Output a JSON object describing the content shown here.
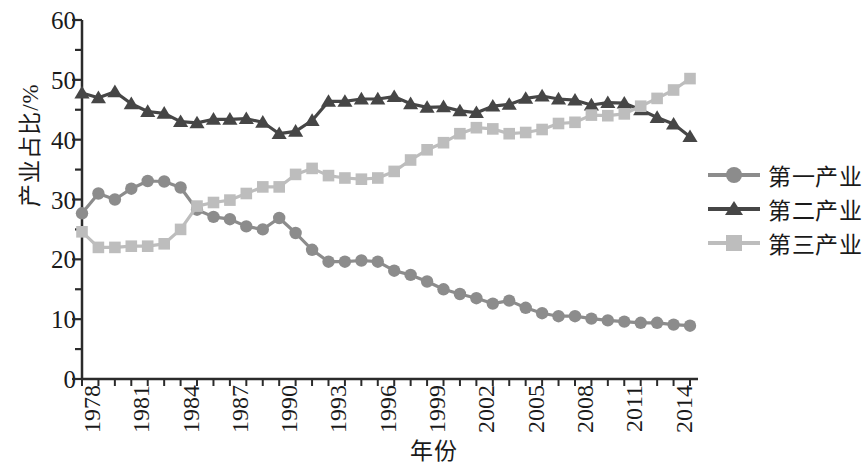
{
  "chart_data": {
    "type": "line",
    "title": "",
    "xlabel": "年份",
    "ylabel": "产业占比/%",
    "ylim": [
      0,
      60
    ],
    "yticks": [
      0,
      10,
      20,
      30,
      40,
      50,
      60
    ],
    "xlim": [
      1978,
      2015
    ],
    "xticks": [
      1978,
      1981,
      1984,
      1987,
      1990,
      1993,
      1996,
      1999,
      2002,
      2005,
      2008,
      2011,
      2014
    ],
    "grid": false,
    "legend_position": "right",
    "x": [
      1978,
      1979,
      1980,
      1981,
      1982,
      1983,
      1984,
      1985,
      1986,
      1987,
      1988,
      1989,
      1990,
      1991,
      1992,
      1993,
      1994,
      1995,
      1996,
      1997,
      1998,
      1999,
      2000,
      2001,
      2002,
      2003,
      2004,
      2005,
      2006,
      2007,
      2008,
      2009,
      2010,
      2011,
      2012,
      2013,
      2014,
      2015
    ],
    "series": [
      {
        "name": "第一产业",
        "marker": "circle",
        "color": "#8c8c8c",
        "values": [
          27.7,
          31.0,
          30.0,
          31.8,
          33.1,
          33.0,
          32.0,
          28.3,
          27.1,
          26.7,
          25.5,
          25.0,
          26.9,
          24.4,
          21.6,
          19.6,
          19.6,
          19.8,
          19.6,
          18.1,
          17.4,
          16.3,
          15.0,
          14.2,
          13.5,
          12.6,
          13.1,
          11.9,
          11.0,
          10.5,
          10.5,
          10.1,
          9.8,
          9.6,
          9.4,
          9.4,
          9.1,
          8.9
        ]
      },
      {
        "name": "第二产业",
        "marker": "triangle",
        "color": "#464646",
        "values": [
          47.8,
          47.0,
          48.0,
          46.0,
          44.7,
          44.4,
          43.0,
          42.8,
          43.4,
          43.4,
          43.5,
          42.9,
          41.0,
          41.4,
          43.2,
          46.4,
          46.4,
          46.8,
          46.8,
          47.2,
          46.0,
          45.4,
          45.5,
          44.8,
          44.5,
          45.6,
          45.9,
          46.9,
          47.3,
          46.8,
          46.6,
          45.8,
          46.2,
          46.1,
          45.0,
          43.7,
          42.6,
          40.5
        ]
      },
      {
        "name": "第三产业",
        "marker": "square",
        "color": "#bdbdbd",
        "values": [
          24.6,
          22.0,
          22.0,
          22.2,
          22.2,
          22.6,
          25.0,
          28.9,
          29.5,
          29.9,
          31.0,
          32.1,
          32.1,
          34.2,
          35.2,
          34.0,
          33.6,
          33.4,
          33.6,
          34.7,
          36.6,
          38.3,
          39.5,
          41.0,
          42.0,
          41.8,
          41.0,
          41.2,
          41.7,
          42.7,
          42.9,
          44.1,
          44.0,
          44.3,
          45.6,
          46.9,
          48.3,
          50.2
        ]
      }
    ]
  },
  "legend": {
    "items": [
      {
        "label": "第一产业"
      },
      {
        "label": "第二产业"
      },
      {
        "label": "第三产业"
      }
    ]
  }
}
